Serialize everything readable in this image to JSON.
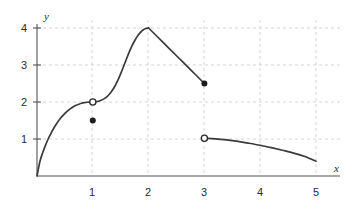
{
  "chart_data": {
    "type": "line",
    "title": "",
    "subtitle": "",
    "xlabel": "x",
    "ylabel": "y",
    "xlim": [
      0,
      5
    ],
    "ylim": [
      0,
      4.3
    ],
    "grid": true,
    "legend": false,
    "legend_position": "none",
    "x_ticks": [
      {
        "value": 1,
        "label": "1"
      },
      {
        "value": 2,
        "label": "2"
      },
      {
        "value": 3,
        "label": "3"
      },
      {
        "value": 4,
        "label": "4"
      },
      {
        "value": 5,
        "label": "5"
      }
    ],
    "y_ticks": [
      {
        "value": 1,
        "label": "1"
      },
      {
        "value": 2,
        "label": "2"
      },
      {
        "value": 3,
        "label": "3"
      },
      {
        "value": 4,
        "label": "4"
      }
    ],
    "series": [
      {
        "name": "branch-0-to-1",
        "description": "concave-down rise from origin to (1,2)",
        "points": [
          [
            0.0,
            0.0
          ],
          [
            0.05,
            0.38
          ],
          [
            0.1,
            0.62
          ],
          [
            0.15,
            0.82
          ],
          [
            0.2,
            1.0
          ],
          [
            0.25,
            1.15
          ],
          [
            0.3,
            1.29
          ],
          [
            0.35,
            1.41
          ],
          [
            0.4,
            1.52
          ],
          [
            0.45,
            1.61
          ],
          [
            0.5,
            1.69
          ],
          [
            0.55,
            1.76
          ],
          [
            0.6,
            1.82
          ],
          [
            0.65,
            1.87
          ],
          [
            0.7,
            1.91
          ],
          [
            0.75,
            1.94
          ],
          [
            0.8,
            1.965
          ],
          [
            0.85,
            1.982
          ],
          [
            0.9,
            1.993
          ],
          [
            0.95,
            1.998
          ],
          [
            1.0,
            2.0
          ]
        ]
      },
      {
        "name": "branch-1-to-2",
        "description": "flat then steeply convex rise from (1,2) to peak (2,4)",
        "points": [
          [
            1.0,
            2.0
          ],
          [
            1.05,
            2.005
          ],
          [
            1.1,
            2.02
          ],
          [
            1.15,
            2.045
          ],
          [
            1.2,
            2.085
          ],
          [
            1.25,
            2.14
          ],
          [
            1.3,
            2.215
          ],
          [
            1.35,
            2.315
          ],
          [
            1.4,
            2.44
          ],
          [
            1.45,
            2.59
          ],
          [
            1.5,
            2.765
          ],
          [
            1.55,
            2.955
          ],
          [
            1.6,
            3.15
          ],
          [
            1.65,
            3.34
          ],
          [
            1.7,
            3.51
          ],
          [
            1.75,
            3.655
          ],
          [
            1.8,
            3.78
          ],
          [
            1.85,
            3.875
          ],
          [
            1.9,
            3.945
          ],
          [
            1.95,
            3.985
          ],
          [
            2.0,
            4.0
          ]
        ]
      },
      {
        "name": "branch-2-to-3",
        "description": "straight descent from peak (2,4) to (3,2.5)",
        "points": [
          [
            2.0,
            4.0
          ],
          [
            2.25,
            3.625
          ],
          [
            2.5,
            3.25
          ],
          [
            2.75,
            2.875
          ],
          [
            3.0,
            2.5
          ]
        ]
      },
      {
        "name": "branch-3-to-5",
        "description": "slow concave decay from (3,1.02) to (5,0.4)",
        "points": [
          [
            3.0,
            1.02
          ],
          [
            3.2,
            1.005
          ],
          [
            3.4,
            0.975
          ],
          [
            3.6,
            0.935
          ],
          [
            3.8,
            0.885
          ],
          [
            4.0,
            0.83
          ],
          [
            4.2,
            0.765
          ],
          [
            4.4,
            0.695
          ],
          [
            4.6,
            0.62
          ],
          [
            4.8,
            0.525
          ],
          [
            5.0,
            0.4
          ]
        ]
      }
    ],
    "markers": [
      {
        "name": "open-circle-at-1-2",
        "x": 1,
        "y": 2.0,
        "style": "open",
        "label": ""
      },
      {
        "name": "filled-dot-at-1-1.5",
        "x": 1,
        "y": 1.5,
        "style": "filled",
        "label": ""
      },
      {
        "name": "filled-dot-at-3-2.5",
        "x": 3,
        "y": 2.5,
        "style": "filled",
        "label": ""
      },
      {
        "name": "open-circle-at-3-1",
        "x": 3,
        "y": 1.02,
        "style": "open",
        "label": ""
      }
    ],
    "colors": {
      "curve": "#3a3a3a",
      "grid": "#c9c9c9",
      "axis": "#555555",
      "marker_fill": "#1c1c1c",
      "background": "#ffffff"
    }
  }
}
